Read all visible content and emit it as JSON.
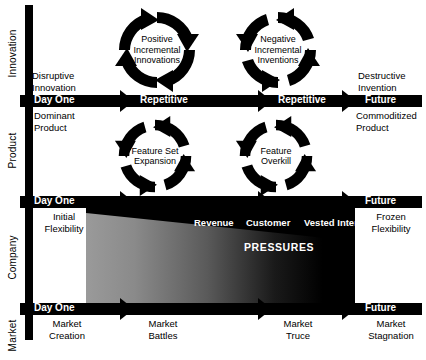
{
  "diagram": {
    "colors": {
      "ink": "#000000",
      "paper": "#ffffff",
      "gradient_start": "#9a9a9a",
      "gradient_end": "#000000"
    }
  },
  "axes": [
    {
      "label": "Innovation"
    },
    {
      "label": "Product"
    },
    {
      "label": "Company"
    },
    {
      "label": "Market"
    }
  ],
  "bars": [
    {
      "start_label": "Day One",
      "mid_label": "Repetitive",
      "mid_label_2": "Repetitive",
      "end_label": "Future"
    },
    {
      "start_label": "Day One",
      "end_label": "Future"
    },
    {
      "start_label": "Day One",
      "end_label": "Future"
    }
  ],
  "rows": {
    "innovation": {
      "left": "Disruptive\nInnovation",
      "right": "Destructive\nInvention",
      "cycles": [
        {
          "label": "Positive\nIncremental\nInnovations"
        },
        {
          "label": "Negative\nIncremental\nInventions"
        }
      ]
    },
    "product": {
      "left": "Dominant\nProduct",
      "right": "Commoditized\nProduct",
      "cycles": [
        {
          "label": "Feature Set\nExpansion"
        },
        {
          "label": "Feature\nOverkill"
        }
      ]
    },
    "company": {
      "left": "Initial\nFlexibility",
      "right": "Frozen\nFlexibility",
      "pressure_words": [
        "Revenue",
        "Customer",
        "Vested Interests"
      ],
      "pressure_title": "PRESSURES"
    },
    "market": {
      "items": [
        "Market\nCreation",
        "Market\nBattles",
        "Market\nTruce",
        "Market\nStagnation"
      ]
    }
  }
}
